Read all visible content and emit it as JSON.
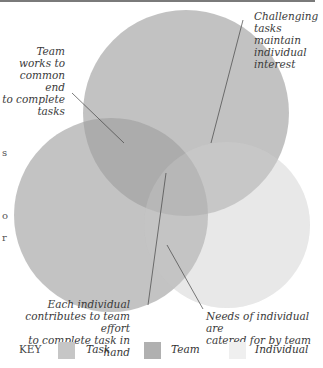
{
  "diagram": {
    "type": "venn",
    "circles": [
      {
        "name": "Task",
        "color": "#c2c2c2"
      },
      {
        "name": "Team",
        "color": "#b3b3b3"
      },
      {
        "name": "Individual",
        "color": "#ececec"
      }
    ],
    "annotations": {
      "team_task": [
        "Team works to",
        "common end",
        "to complete",
        "tasks"
      ],
      "task_individual": [
        "Challenging",
        "tasks maintain",
        "individual",
        "interest"
      ],
      "center": [
        "Each individual",
        "contributes to team effort",
        "to complete task in hand"
      ],
      "team_individual": [
        "Needs of individual are",
        "catered for by team"
      ]
    },
    "edge_fragments": [
      "s",
      "o",
      "r"
    ]
  },
  "key": {
    "label": "KEY",
    "items": [
      {
        "label": "Task",
        "color": "#c6c6c6"
      },
      {
        "label": "Team",
        "color": "#b0b0b0"
      },
      {
        "label": "Individual",
        "color": "#efefef"
      }
    ]
  }
}
